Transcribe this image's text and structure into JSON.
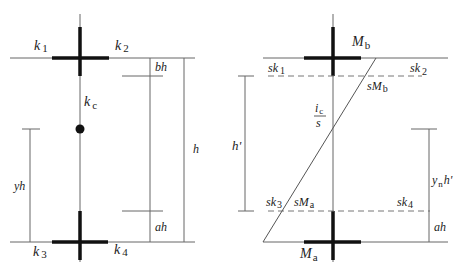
{
  "left_diagram": {
    "labels": {
      "k1": "k",
      "k1_sub": "1",
      "k2": "k",
      "k2_sub": "2",
      "k3": "k",
      "k3_sub": "3",
      "k4": "k",
      "k4_sub": "4",
      "kc": "k",
      "kc_sub": "c",
      "bh": "bh",
      "ah": "ah",
      "h": "h",
      "yh": "yh"
    }
  },
  "right_diagram": {
    "labels": {
      "Mb": "M",
      "Mb_sub": "b",
      "Ma": "M",
      "Ma_sub": "a",
      "sk1": "sk",
      "sk1_sub": "1",
      "sk2": "sk",
      "sk2_sub": "2",
      "sk3": "sk",
      "sk3_sub": "3",
      "sk4": "sk",
      "sk4_sub": "4",
      "sMb": "sM",
      "sMb_sub": "b",
      "sMa": "sM",
      "sMa_sub": "a",
      "ic_num": "i",
      "ic_num_sub": "c",
      "ic_den": "s",
      "h_prime": "h'",
      "yn_h": "y",
      "yn_sub": "n",
      "yn_h_tail": "h'",
      "ah": "ah"
    }
  },
  "colors": {
    "line": "#555555",
    "thick": "#111111",
    "dashed": "#777777"
  }
}
